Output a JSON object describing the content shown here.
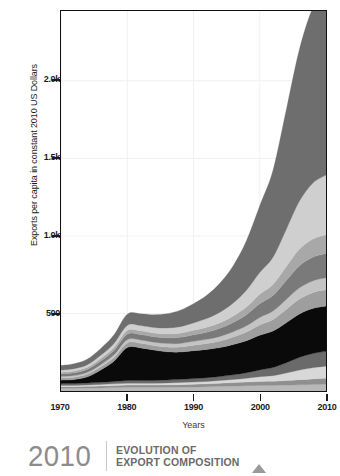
{
  "axes": {
    "y_title": "Exports per capita in constant 2010 US Dollars",
    "x_title": "Years",
    "y_ticks": [
      "500",
      "1.0k",
      "1.5k",
      "2.0k"
    ],
    "x_ticks": [
      "1970",
      "1980",
      "1990",
      "2000",
      "2010"
    ]
  },
  "caption": {
    "year": "2010",
    "line1": "EVOLUTION OF",
    "line2": "EXPORT COMPOSITION",
    "marker": "triangle-up-icon"
  },
  "colors": {
    "frame": "#111111",
    "grid": "#f0f0f0",
    "text": "#1a1a1a",
    "caption_year": "#8c8c8c",
    "caption_text": "#6a6a6a",
    "marker": "#9a9a9a"
  },
  "chart_data": {
    "type": "area",
    "title": "EVOLUTION OF EXPORT COMPOSITION",
    "xlabel": "Years",
    "ylabel": "Exports per capita in constant 2010 US Dollars",
    "xlim": [
      1970,
      2010
    ],
    "ylim": [
      0,
      2450
    ],
    "ytick_values": [
      500,
      1000,
      1500,
      2000
    ],
    "ytick_labels": [
      "500",
      "1.0k",
      "1.5k",
      "2.0k"
    ],
    "xtick_values": [
      1970,
      1980,
      1990,
      2000,
      2010
    ],
    "xtick_labels": [
      "1970",
      "1980",
      "1990",
      "2000",
      "2010"
    ],
    "grid": true,
    "legend": "none",
    "stacked": true,
    "x": [
      1970,
      1972,
      1974,
      1976,
      1978,
      1980,
      1982,
      1984,
      1986,
      1988,
      1990,
      1992,
      1994,
      1996,
      1998,
      2000,
      2002,
      2004,
      2006,
      2008,
      2010
    ],
    "series": [
      {
        "name": "layer-1",
        "color": "#b8b8b8",
        "values": [
          18,
          18,
          19,
          20,
          22,
          24,
          24,
          24,
          24,
          25,
          26,
          28,
          30,
          32,
          34,
          36,
          36,
          38,
          40,
          42,
          44
        ]
      },
      {
        "name": "layer-2",
        "color": "#8f8f8f",
        "values": [
          10,
          10,
          11,
          12,
          13,
          14,
          14,
          14,
          15,
          16,
          17,
          18,
          20,
          22,
          24,
          26,
          27,
          30,
          33,
          36,
          38
        ]
      },
      {
        "name": "layer-3",
        "color": "#d8d8d8",
        "values": [
          8,
          8,
          9,
          10,
          11,
          12,
          12,
          12,
          13,
          14,
          15,
          16,
          18,
          20,
          24,
          30,
          36,
          48,
          62,
          72,
          78
        ]
      },
      {
        "name": "layer-4",
        "color": "#6a6a6a",
        "values": [
          12,
          12,
          13,
          14,
          16,
          18,
          18,
          18,
          19,
          20,
          22,
          24,
          26,
          30,
          36,
          44,
          52,
          66,
          82,
          92,
          96
        ]
      },
      {
        "name": "layer-5-oil",
        "color": "#0a0a0a",
        "values": [
          22,
          26,
          40,
          80,
          130,
          212,
          210,
          196,
          182,
          176,
          180,
          182,
          186,
          196,
          206,
          224,
          236,
          258,
          280,
          290,
          292
        ]
      },
      {
        "name": "layer-6",
        "color": "#9e9e9e",
        "values": [
          14,
          15,
          17,
          20,
          24,
          30,
          30,
          30,
          31,
          33,
          35,
          38,
          42,
          48,
          56,
          66,
          74,
          86,
          96,
          102,
          104
        ]
      },
      {
        "name": "layer-7",
        "color": "#c4c4c4",
        "values": [
          10,
          11,
          12,
          14,
          17,
          21,
          21,
          21,
          22,
          23,
          25,
          27,
          30,
          34,
          40,
          48,
          54,
          64,
          72,
          76,
          78
        ]
      },
      {
        "name": "layer-8",
        "color": "#7a7a7a",
        "values": [
          16,
          17,
          19,
          23,
          28,
          35,
          35,
          35,
          37,
          39,
          42,
          46,
          52,
          60,
          72,
          88,
          100,
          122,
          142,
          152,
          156
        ]
      },
      {
        "name": "layer-9",
        "color": "#a8a8a8",
        "values": [
          11,
          12,
          13,
          16,
          19,
          24,
          24,
          24,
          25,
          27,
          29,
          32,
          36,
          42,
          50,
          62,
          72,
          90,
          108,
          118,
          122
        ]
      },
      {
        "name": "layer-10",
        "color": "#cfcfcf",
        "values": [
          14,
          15,
          17,
          21,
          26,
          33,
          34,
          35,
          38,
          42,
          48,
          56,
          68,
          84,
          108,
          140,
          176,
          240,
          310,
          360,
          384
        ]
      },
      {
        "name": "layer-11",
        "color": "#6e6e6e",
        "values": [
          30,
          32,
          36,
          44,
          56,
          72,
          76,
          82,
          92,
          106,
          124,
          150,
          188,
          240,
          320,
          430,
          560,
          770,
          980,
          1130,
          1210
        ]
      }
    ]
  }
}
